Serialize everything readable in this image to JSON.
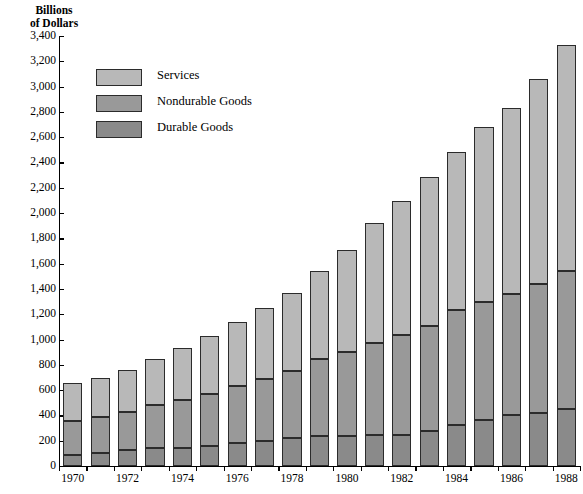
{
  "chart_data": {
    "type": "bar",
    "subtype": "stacked-vertical",
    "title": "",
    "ylabel": "Billions\nof Dollars",
    "xlabel": "",
    "ylim": [
      0,
      3400
    ],
    "ytick_step": 200,
    "ytick_labels": [
      "3,400",
      "3,200",
      "3,000",
      "2,800",
      "2,600",
      "2,400",
      "2,200",
      "2,000",
      "1,800",
      "1,600",
      "1,400",
      "1,200",
      "1,000",
      "800",
      "600",
      "400",
      "200",
      "0"
    ],
    "ytick_values": [
      3400,
      3200,
      3000,
      2800,
      2600,
      2400,
      2200,
      2000,
      1800,
      1600,
      1400,
      1200,
      1000,
      800,
      600,
      400,
      200,
      0
    ],
    "grid": false,
    "legend_position": "upper-left-inside",
    "categories": [
      "1970",
      "1971",
      "1972",
      "1973",
      "1974",
      "1975",
      "1976",
      "1977",
      "1978",
      "1979",
      "1980",
      "1981",
      "1982",
      "1983",
      "1984",
      "1985",
      "1986",
      "1987",
      "1988"
    ],
    "xtick_labels_shown": [
      "1970",
      "1972",
      "1974",
      "1976",
      "1978",
      "1980",
      "1982",
      "1984",
      "1986",
      "1988"
    ],
    "series": [
      {
        "name": "Durable Goods",
        "color": "#8a8a8a",
        "values": [
          90,
          105,
          125,
          140,
          140,
          155,
          180,
          200,
          220,
          235,
          235,
          245,
          245,
          280,
          325,
          365,
          400,
          420,
          450
        ]
      },
      {
        "name": "Nondurable Goods",
        "color": "#999999",
        "values": [
          265,
          285,
          305,
          340,
          385,
          415,
          450,
          490,
          530,
          610,
          670,
          730,
          790,
          830,
          910,
          930,
          960,
          1020,
          1095
        ]
      },
      {
        "name": "Services",
        "color": "#b8b8b8",
        "values": [
          300,
          305,
          330,
          370,
          410,
          460,
          510,
          560,
          620,
          695,
          805,
          945,
          1060,
          1175,
          1245,
          1385,
          1470,
          1620,
          1785
        ]
      }
    ],
    "totals": [
      655,
      695,
      760,
      850,
      935,
      1030,
      1140,
      1250,
      1370,
      1540,
      1710,
      1920,
      2095,
      2285,
      2480,
      2680,
      2830,
      3060,
      3330
    ],
    "legend": [
      {
        "label": "Services",
        "color": "#b8b8b8"
      },
      {
        "label": "Nondurable Goods",
        "color": "#999999"
      },
      {
        "label": "Durable Goods",
        "color": "#8a8a8a"
      }
    ]
  }
}
